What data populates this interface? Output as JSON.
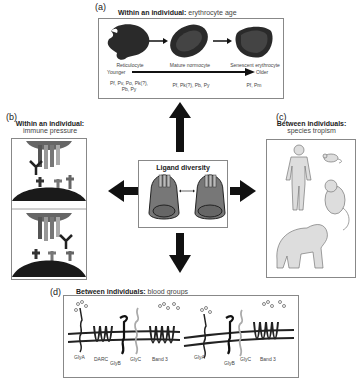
{
  "panel_a": {
    "letter": "(a)",
    "title_bold": "Within an individual:",
    "title_sub": " erythrocyte age",
    "cells": [
      {
        "label": "Reticulocyte",
        "species": "Pf, Pv, Po, Pk(?),",
        "species2": "Pb, Py"
      },
      {
        "label": "Mature normocyte",
        "species": "Pf, Pk(?), Pb, Py",
        "species2": ""
      },
      {
        "label": "Senescent erythrocyte",
        "species": "Pf, Pm",
        "species2": ""
      }
    ],
    "axis_left": "Younger",
    "axis_right": "Older"
  },
  "panel_b": {
    "letter": "(b)",
    "title_bold": "Within an individual:",
    "title_sub": "immune pressure"
  },
  "panel_c": {
    "letter": "(c)",
    "title_bold": "Between individuals:",
    "title_sub": "species tropism",
    "organisms": [
      "human-icon",
      "mouse-icon",
      "monkey-icon",
      "gorilla-icon"
    ]
  },
  "center": {
    "title": "Ligand diversity"
  },
  "panel_d": {
    "letter": "(d)",
    "title_bold": "Between individuals:",
    "title_sub": " blood groups",
    "left_labels": [
      "GlyA",
      "DARC",
      "GlyB",
      "GlyC",
      "Band 3"
    ],
    "right_labels": [
      "GlyA",
      "GlyB",
      "GlyC",
      "Band 3"
    ]
  },
  "colors": {
    "cell_dark": "#2a2a2a",
    "merozoite_fill": "#777777",
    "panel_border": "#888888",
    "arrow": "#111111",
    "glyc_grey": "#aaaaaa"
  }
}
